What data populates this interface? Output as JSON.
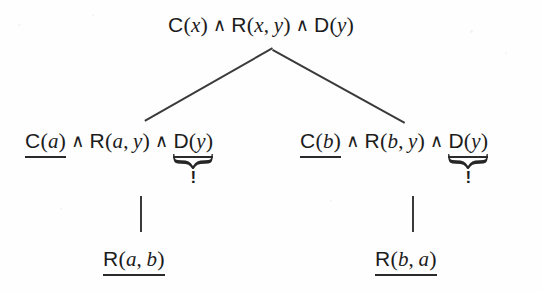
{
  "figure": {
    "kind": "proof-tree",
    "background_color": "#fefefe",
    "ink_color": "#1c1c1c"
  },
  "symbols": {
    "conjunction": "∧",
    "comma": ",",
    "open_paren": "(",
    "close_paren": ")",
    "bang": "!"
  },
  "nodes": {
    "root": {
      "id": "root",
      "atoms": [
        {
          "predicate": "C",
          "args": [
            "x"
          ],
          "underlined": false,
          "braced": false
        },
        {
          "predicate": "R",
          "args": [
            "x",
            "y"
          ],
          "underlined": false,
          "braced": false
        },
        {
          "predicate": "D",
          "args": [
            "y"
          ],
          "underlined": false,
          "braced": false
        }
      ]
    },
    "left_child": {
      "id": "left-child",
      "atoms": [
        {
          "predicate": "C",
          "args": [
            "a"
          ],
          "underlined": true,
          "braced": false
        },
        {
          "predicate": "R",
          "args": [
            "a",
            "y"
          ],
          "underlined": false,
          "braced": false
        },
        {
          "predicate": "D",
          "args": [
            "y"
          ],
          "underlined": true,
          "braced": true,
          "marker": "!"
        }
      ]
    },
    "right_child": {
      "id": "right-child",
      "atoms": [
        {
          "predicate": "C",
          "args": [
            "b"
          ],
          "underlined": true,
          "braced": false
        },
        {
          "predicate": "R",
          "args": [
            "b",
            "y"
          ],
          "underlined": false,
          "braced": false
        },
        {
          "predicate": "D",
          "args": [
            "y"
          ],
          "underlined": true,
          "braced": true,
          "marker": "!"
        }
      ]
    },
    "left_leaf": {
      "id": "left-leaf",
      "atoms": [
        {
          "predicate": "R",
          "args": [
            "a",
            "b"
          ],
          "underlined": true,
          "braced": false
        }
      ]
    },
    "right_leaf": {
      "id": "right-leaf",
      "atoms": [
        {
          "predicate": "R",
          "args": [
            "b",
            "a"
          ],
          "underlined": true,
          "braced": false
        }
      ]
    }
  },
  "edges": [
    {
      "from": "root",
      "to": "left-child",
      "style": "diagonal"
    },
    {
      "from": "root",
      "to": "right-child",
      "style": "diagonal"
    },
    {
      "from": "left-child",
      "to": "left-leaf",
      "style": "vertical"
    },
    {
      "from": "right-child",
      "to": "right-leaf",
      "style": "vertical"
    }
  ]
}
